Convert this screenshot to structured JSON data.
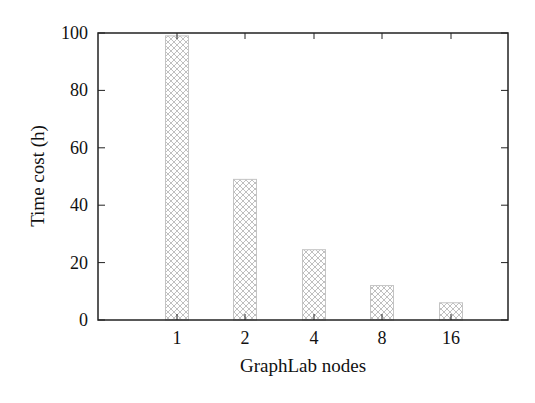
{
  "chart_data": {
    "type": "bar",
    "title": "",
    "xlabel": "GraphLab nodes",
    "ylabel": "Time cost (h)",
    "categories": [
      "1",
      "2",
      "4",
      "8",
      "16"
    ],
    "values": [
      99,
      49,
      24.5,
      12,
      6
    ],
    "ylim": [
      0,
      100
    ],
    "yticks": [
      0,
      20,
      40,
      60,
      80,
      100
    ],
    "grid": false,
    "legend": null,
    "bar_fill": "cross-hatch",
    "bar_color": "#b8b8b8"
  }
}
